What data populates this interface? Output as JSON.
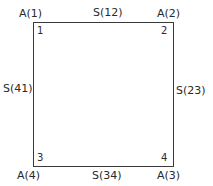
{
  "diagram": {
    "type": "square-element",
    "corner_labels": {
      "top_left": "A(1)",
      "top_right": "A(2)",
      "bottom_left": "A(4)",
      "bottom_right": "A(3)"
    },
    "side_labels": {
      "top": "S(12)",
      "right": "S(23)",
      "bottom": "S(34)",
      "left": "S(41)"
    },
    "node_numbers": {
      "top_left": "1",
      "top_right": "2",
      "bottom_left": "3",
      "bottom_right": "4"
    },
    "colors": {
      "line": "#3a3a3a",
      "text": "#2a2a2a",
      "background": "#ffffff"
    }
  }
}
